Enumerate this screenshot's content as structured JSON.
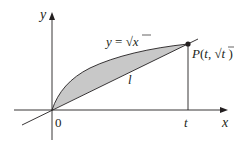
{
  "figure": {
    "axis_labels": {
      "x": "x",
      "y": "y"
    },
    "origin_label": "0",
    "tick_label_t": "t",
    "curve_label": "y = √x",
    "curve_label_parts": {
      "lhs": "y",
      "eq": " = ",
      "radical": "√",
      "radicand": "x"
    },
    "line_label": "l",
    "point_label": "P(t, √t )",
    "point_label_parts": {
      "name": "P(",
      "t": "t",
      "comma": ", ",
      "radical": "√",
      "radicand": "t",
      "close": " )"
    },
    "colors": {
      "stroke": "#231f20",
      "fill": "#c8c8c8",
      "background": "#ffffff"
    }
  }
}
